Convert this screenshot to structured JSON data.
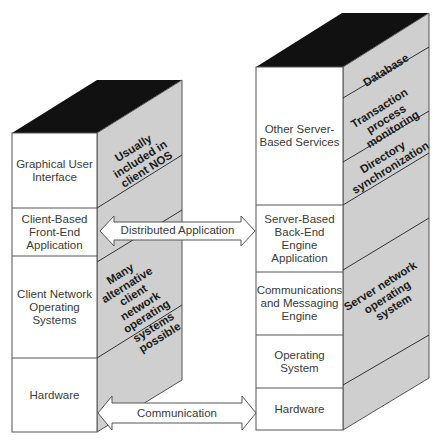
{
  "colors": {
    "top_face": "#111111",
    "side_face": "#cfcfcf",
    "front_face": "#ffffff",
    "outline": "#555555"
  },
  "client_stack": {
    "front_layers": [
      {
        "label": "Graphical User Interface"
      },
      {
        "label": "Client-Based Front-End Application"
      },
      {
        "label": "Client Network Operating Systems"
      },
      {
        "label": "Hardware"
      }
    ],
    "side_labels": [
      {
        "label": "Usually included in client NOS"
      },
      {
        "label": "Many alternative client network operating systems possible"
      }
    ]
  },
  "server_stack": {
    "front_layers": [
      {
        "label": "Other Server-Based Services"
      },
      {
        "label": "Server-Based Back-End Engine Application"
      },
      {
        "label": "Communications and Messaging Engine"
      },
      {
        "label": "Operating System"
      },
      {
        "label": "Hardware"
      }
    ],
    "side_labels": [
      {
        "label": "Database"
      },
      {
        "label": "Transaction process monitoring"
      },
      {
        "label": "Directory synchronization"
      },
      {
        "label": "Server network operating system"
      }
    ]
  },
  "connections": [
    {
      "label": "Distributed Application",
      "from": "Client-Based Front-End Application",
      "to": "Server-Based Back-End Engine Application",
      "type": "double-arrow"
    },
    {
      "label": "Communication",
      "from": "Hardware",
      "to": "Hardware",
      "type": "double-arrow"
    }
  ]
}
